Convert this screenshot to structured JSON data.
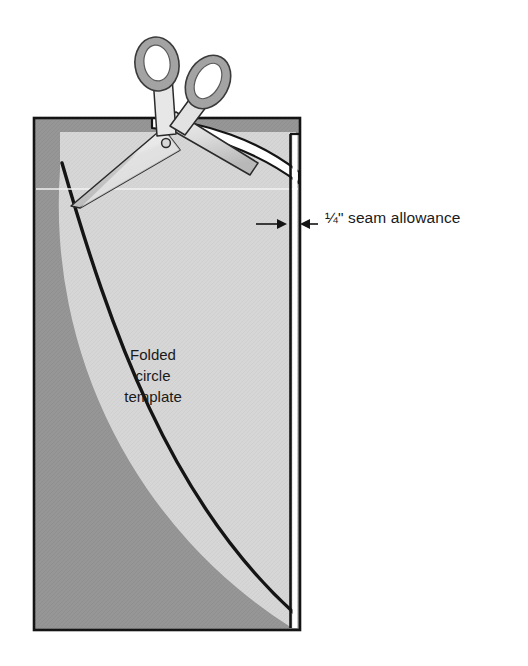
{
  "figure": {
    "type": "sewing-instruction-diagram"
  },
  "annotations": {
    "seam_allowance_label": "¼\" seam allowance",
    "template_label_lines": [
      "Folded",
      "circle",
      "template"
    ]
  },
  "colors": {
    "fabric_dark": "#969696",
    "template_light": "#d6d6d6",
    "cut_strip": "#ffffff",
    "outline": "#141414",
    "scissors_handle": "#a3a3a3",
    "scissors_handle_edge": "#6e6e6e",
    "scissors_blade_light": "#efefef",
    "scissors_blade_mid": "#cfcfcf",
    "scissors_blade_shadow": "#b5b5b5",
    "text": "#1a1a1a",
    "background": "#ffffff",
    "fold_line": "#f2f2f2"
  },
  "elements": {
    "fabric_rect": "fabric-rectangle",
    "template_quarter_circle": "folded-circle-template",
    "seam_strip": "seam-allowance-strip",
    "cut_line": "cut-curve-line",
    "cut_off_strip": "cut-away-strip",
    "fold_line": "fold-line",
    "scissors": "scissors",
    "arrow_left": "seam-arrow-left",
    "arrow_right": "seam-arrow-right",
    "leader_line": "seam-leader-line"
  },
  "geometry": {
    "fabric": {
      "x": 34,
      "y": 118,
      "w": 266,
      "h": 512
    },
    "seam_strip": {
      "x": 289,
      "y": 132,
      "w": 7,
      "h": 494
    },
    "label_arrow_y": 224
  }
}
